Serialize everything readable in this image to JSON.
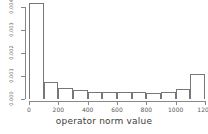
{
  "chart_data": {
    "type": "bar",
    "title": "",
    "subtitle": "",
    "xlabel": "operator norm value",
    "ylabel": "",
    "legend": [],
    "grid": false,
    "xlim": [
      0,
      1200
    ],
    "ylim": [
      0,
      0.004
    ],
    "xticks": [
      0,
      200,
      400,
      600,
      800,
      1000,
      1200
    ],
    "xtick_labels": [
      "0",
      "200",
      "400",
      "600",
      "800",
      "1000",
      "1200"
    ],
    "yticks": [
      0,
      0.001,
      0.002,
      0.003,
      0.004
    ],
    "ytick_labels": [
      "0.000",
      "0.001",
      "0.002",
      "0.003",
      "0.004"
    ],
    "bin_width": 100,
    "bin_edges": [
      0,
      100,
      200,
      300,
      400,
      500,
      600,
      700,
      800,
      900,
      1000,
      1100,
      1200
    ],
    "categories": [
      "0-100",
      "100-200",
      "200-300",
      "300-400",
      "400-500",
      "500-600",
      "600-700",
      "700-800",
      "800-900",
      "900-1000",
      "1000-1100",
      "1100-1200"
    ],
    "values": [
      0.00404,
      0.00072,
      0.00048,
      0.00036,
      0.00028,
      0.0003,
      0.00028,
      0.00028,
      0.00027,
      0.00029,
      0.00044,
      0.00105
    ],
    "bar_fill_color": "#ffffff",
    "bar_edge_color": "#777777",
    "axis_color": "#888888",
    "text_color": "#555555",
    "background_color": "#ffffff"
  },
  "figure": {
    "x_axis_title": "operator norm value"
  }
}
